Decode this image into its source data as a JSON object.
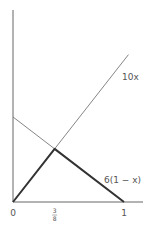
{
  "chart_data": {
    "type": "line",
    "title": "",
    "xlabel": "",
    "ylabel": "",
    "xlim": [
      0,
      1.15
    ],
    "ylim": [
      0,
      13.5
    ],
    "grid": false,
    "legend": "none",
    "x_ticks": [
      {
        "value": 0,
        "label": "0"
      },
      {
        "value": 0.375,
        "label_num": "3",
        "label_den": "8"
      },
      {
        "value": 1,
        "label": "1"
      }
    ],
    "series": [
      {
        "name": "10x",
        "label": "10x",
        "points": [
          [
            0,
            0
          ],
          [
            1.04,
            10.4
          ]
        ],
        "style": "thin"
      },
      {
        "name": "6(1-x)",
        "label": "6(1 − x)",
        "points": [
          [
            0,
            6
          ],
          [
            1,
            0
          ]
        ],
        "style": "thin"
      },
      {
        "name": "min envelope",
        "label": "",
        "points": [
          [
            0,
            0
          ],
          [
            0.375,
            3.75
          ],
          [
            1,
            0
          ]
        ],
        "style": "thick"
      }
    ],
    "annotations": [
      {
        "text": "10x",
        "anchor_series": "10x"
      },
      {
        "text": "6(1 − x)",
        "anchor_series": "6(1-x)"
      }
    ]
  }
}
